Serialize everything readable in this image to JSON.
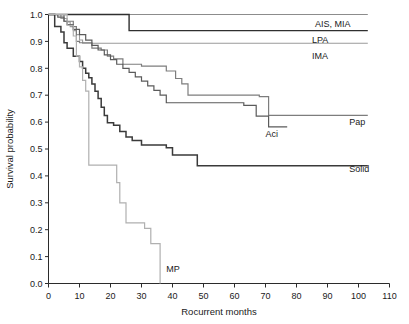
{
  "figure": {
    "background": "#ffffff",
    "width": 409,
    "height": 324
  },
  "chart_data": {
    "type": "line",
    "subtype": "kaplan-meier-step",
    "title": "",
    "xlabel": "Rocurrent months",
    "ylabel": "Survival probability",
    "xlim": [
      0,
      110
    ],
    "ylim": [
      0.0,
      1.0
    ],
    "xticks": [
      0,
      10,
      20,
      30,
      40,
      50,
      60,
      70,
      80,
      90,
      100,
      110
    ],
    "xticklabels": [
      "0",
      "10",
      "20",
      "30",
      "40",
      "50",
      "60",
      "70",
      "80",
      "90",
      "100",
      "110"
    ],
    "yticks": [
      0.0,
      0.1,
      0.2,
      0.3,
      0.4,
      0.5,
      0.6,
      0.7,
      0.8,
      0.9,
      1.0
    ],
    "yticklabels": [
      "0.0",
      "0.1",
      "0.2",
      "0.3",
      "0.4",
      "0.5",
      "0.6",
      "0.7",
      "0.8",
      "0.9",
      "1.0"
    ],
    "grid": false,
    "legend_position": "inline-curve-end-labels",
    "series": [
      {
        "name": "AIS, MIA",
        "color": "#8c8c8c",
        "width": 1.1,
        "label_x": 86,
        "label_y": 0.965,
        "label_anchor": "start",
        "points": [
          [
            0,
            1.0
          ],
          [
            103,
            1.0
          ]
        ]
      },
      {
        "name": "LPA",
        "color": "#9a9a9a",
        "width": 1.1,
        "label_x": 85,
        "label_y": 0.905,
        "label_anchor": "start",
        "points": [
          [
            0,
            1.0
          ],
          [
            4,
            1.0
          ],
          [
            4,
            0.985
          ],
          [
            6,
            0.985
          ],
          [
            6,
            0.972
          ],
          [
            7,
            0.972
          ],
          [
            7,
            0.955
          ],
          [
            8,
            0.955
          ],
          [
            8,
            0.94
          ],
          [
            9,
            0.94
          ],
          [
            9,
            0.925
          ],
          [
            10,
            0.925
          ],
          [
            10,
            0.905
          ],
          [
            11,
            0.905
          ],
          [
            11,
            0.893
          ],
          [
            103,
            0.893
          ]
        ]
      },
      {
        "name": "IMA",
        "color": "#2f2f2f",
        "width": 1.4,
        "label_x": 85,
        "label_y": 0.845,
        "label_anchor": "start",
        "points": [
          [
            0,
            1.0
          ],
          [
            26,
            1.0
          ],
          [
            26,
            0.94
          ],
          [
            103,
            0.94
          ]
        ]
      },
      {
        "name": "Pap",
        "color": "#7d7d7d",
        "width": 1.2,
        "label_x": 97,
        "label_y": 0.6,
        "label_anchor": "start",
        "points": [
          [
            0,
            1.0
          ],
          [
            5,
            1.0
          ],
          [
            5,
            0.975
          ],
          [
            8,
            0.975
          ],
          [
            8,
            0.955
          ],
          [
            9,
            0.955
          ],
          [
            9,
            0.9
          ],
          [
            10,
            0.9
          ],
          [
            10,
            0.895
          ],
          [
            14,
            0.895
          ],
          [
            14,
            0.875
          ],
          [
            17,
            0.875
          ],
          [
            17,
            0.868
          ],
          [
            19,
            0.868
          ],
          [
            19,
            0.845
          ],
          [
            21,
            0.845
          ],
          [
            21,
            0.835
          ],
          [
            24,
            0.835
          ],
          [
            24,
            0.815
          ],
          [
            30,
            0.815
          ],
          [
            30,
            0.808
          ],
          [
            38,
            0.808
          ],
          [
            38,
            0.79
          ],
          [
            41,
            0.79
          ],
          [
            41,
            0.762
          ],
          [
            43,
            0.762
          ],
          [
            43,
            0.742
          ],
          [
            45,
            0.742
          ],
          [
            45,
            0.7
          ],
          [
            68,
            0.7
          ],
          [
            68,
            0.695
          ],
          [
            71,
            0.695
          ],
          [
            71,
            0.625
          ],
          [
            103,
            0.625
          ]
        ]
      },
      {
        "name": "Aci",
        "color": "#5b5b5b",
        "width": 1.2,
        "label_x": 70,
        "label_y": 0.555,
        "label_anchor": "start",
        "points": [
          [
            0,
            1.0
          ],
          [
            3,
            1.0
          ],
          [
            3,
            0.99
          ],
          [
            5,
            0.99
          ],
          [
            5,
            0.975
          ],
          [
            6,
            0.975
          ],
          [
            6,
            0.962
          ],
          [
            8,
            0.962
          ],
          [
            8,
            0.945
          ],
          [
            10,
            0.945
          ],
          [
            10,
            0.925
          ],
          [
            12,
            0.925
          ],
          [
            12,
            0.905
          ],
          [
            14,
            0.905
          ],
          [
            14,
            0.885
          ],
          [
            16,
            0.885
          ],
          [
            16,
            0.868
          ],
          [
            18,
            0.868
          ],
          [
            18,
            0.85
          ],
          [
            20,
            0.85
          ],
          [
            20,
            0.832
          ],
          [
            22,
            0.832
          ],
          [
            22,
            0.815
          ],
          [
            24,
            0.815
          ],
          [
            24,
            0.8
          ],
          [
            26,
            0.8
          ],
          [
            26,
            0.785
          ],
          [
            28,
            0.785
          ],
          [
            28,
            0.768
          ],
          [
            30,
            0.768
          ],
          [
            30,
            0.752
          ],
          [
            32,
            0.752
          ],
          [
            32,
            0.735
          ],
          [
            34,
            0.735
          ],
          [
            34,
            0.718
          ],
          [
            36,
            0.718
          ],
          [
            36,
            0.7
          ],
          [
            38,
            0.7
          ],
          [
            38,
            0.672
          ],
          [
            63,
            0.672
          ],
          [
            63,
            0.662
          ],
          [
            67,
            0.662
          ],
          [
            67,
            0.622
          ],
          [
            71,
            0.622
          ],
          [
            71,
            0.582
          ],
          [
            77,
            0.582
          ]
        ]
      },
      {
        "name": "Solid",
        "color": "#3a3a3a",
        "width": 1.5,
        "label_x": 97,
        "label_y": 0.425,
        "label_anchor": "start",
        "points": [
          [
            0,
            1.0
          ],
          [
            2,
            1.0
          ],
          [
            2,
            0.955
          ],
          [
            4,
            0.955
          ],
          [
            4,
            0.935
          ],
          [
            5,
            0.935
          ],
          [
            5,
            0.895
          ],
          [
            6,
            0.895
          ],
          [
            6,
            0.875
          ],
          [
            8,
            0.875
          ],
          [
            8,
            0.845
          ],
          [
            10,
            0.845
          ],
          [
            10,
            0.825
          ],
          [
            11,
            0.825
          ],
          [
            11,
            0.8
          ],
          [
            12,
            0.8
          ],
          [
            12,
            0.782
          ],
          [
            13,
            0.782
          ],
          [
            13,
            0.765
          ],
          [
            14,
            0.765
          ],
          [
            14,
            0.742
          ],
          [
            15,
            0.742
          ],
          [
            15,
            0.715
          ],
          [
            16,
            0.715
          ],
          [
            16,
            0.688
          ],
          [
            17,
            0.688
          ],
          [
            17,
            0.655
          ],
          [
            18,
            0.655
          ],
          [
            18,
            0.625
          ],
          [
            19,
            0.625
          ],
          [
            19,
            0.598
          ],
          [
            21,
            0.598
          ],
          [
            21,
            0.588
          ],
          [
            23,
            0.588
          ],
          [
            23,
            0.565
          ],
          [
            25,
            0.565
          ],
          [
            25,
            0.545
          ],
          [
            27,
            0.545
          ],
          [
            27,
            0.532
          ],
          [
            30,
            0.532
          ],
          [
            30,
            0.515
          ],
          [
            38,
            0.515
          ],
          [
            38,
            0.505
          ],
          [
            40,
            0.505
          ],
          [
            40,
            0.478
          ],
          [
            48,
            0.478
          ],
          [
            48,
            0.438
          ],
          [
            103,
            0.438
          ]
        ]
      },
      {
        "name": "MP",
        "color": "#b0b0b0",
        "width": 1.2,
        "label_x": 38,
        "label_y": 0.055,
        "label_anchor": "start",
        "points": [
          [
            0,
            1.0
          ],
          [
            6,
            1.0
          ],
          [
            6,
            0.96
          ],
          [
            8,
            0.96
          ],
          [
            8,
            0.92
          ],
          [
            9,
            0.92
          ],
          [
            9,
            0.845
          ],
          [
            10,
            0.845
          ],
          [
            10,
            0.805
          ],
          [
            11,
            0.805
          ],
          [
            11,
            0.755
          ],
          [
            12,
            0.755
          ],
          [
            12,
            0.715
          ],
          [
            13,
            0.715
          ],
          [
            13,
            0.44
          ],
          [
            22,
            0.44
          ],
          [
            22,
            0.375
          ],
          [
            23,
            0.375
          ],
          [
            23,
            0.3
          ],
          [
            25,
            0.3
          ],
          [
            25,
            0.225
          ],
          [
            31,
            0.225
          ],
          [
            31,
            0.205
          ],
          [
            33,
            0.205
          ],
          [
            33,
            0.148
          ],
          [
            36,
            0.148
          ],
          [
            36,
            0.0
          ]
        ]
      }
    ]
  }
}
